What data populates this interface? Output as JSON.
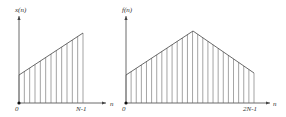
{
  "chart_data": [
    {
      "type": "stem",
      "title": "",
      "ylabel": "x(n)",
      "xlabel": "n",
      "x_ticks": [
        "0",
        "N-1"
      ],
      "n_points": 13,
      "shape": "linear ramp increasing",
      "start_value": 0.35,
      "end_value": 0.85
    },
    {
      "type": "stem",
      "title": "",
      "ylabel": "f(n)",
      "xlabel": "n",
      "x_ticks": [
        "0",
        "2N-1"
      ],
      "n_points": 26,
      "shape": "triangle: ramp up then ramp down",
      "start_value": 0.35,
      "peak_value": 0.88,
      "end_value": 0.35
    }
  ],
  "left": {
    "ylabel": "x(n)",
    "xlabel": "n",
    "origin_label": "0",
    "end_label": "N-1"
  },
  "right": {
    "ylabel": "f(n)",
    "xlabel": "n",
    "origin_label": "0",
    "end_label": "2N-1"
  }
}
